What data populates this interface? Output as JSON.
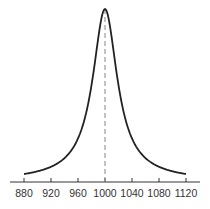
{
  "chart_data": {
    "type": "line",
    "title": "",
    "xlabel": "",
    "ylabel": "",
    "xlim": [
      868,
      1132
    ],
    "x_ticks": [
      880,
      920,
      960,
      1000,
      1040,
      1080,
      1120
    ],
    "tick_labels": [
      "880",
      "920",
      "960",
      "1000",
      "1040",
      "1080",
      "1120"
    ],
    "series": [
      {
        "name": "peak",
        "shape": "lorentzian",
        "center": 1000,
        "half_width": 22,
        "x_range": [
          880,
          1120
        ],
        "x": [
          880,
          920,
          960,
          980,
          990,
          1000,
          1010,
          1020,
          1040,
          1080,
          1120
        ],
        "y": [
          0.06,
          0.12,
          0.26,
          0.55,
          0.83,
          1.0,
          0.83,
          0.55,
          0.26,
          0.12,
          0.06
        ]
      }
    ],
    "reference_line": {
      "x": 1000,
      "style": "dashed"
    },
    "grid": false,
    "colors": {
      "curve": "#222222",
      "axis": "#333333",
      "dashed": "#888888"
    }
  }
}
